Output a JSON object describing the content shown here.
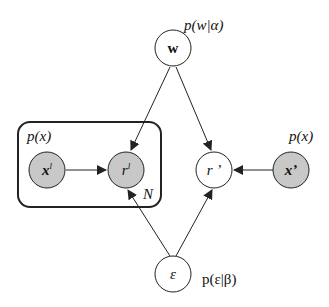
{
  "nodes": {
    "w": {
      "label": "w",
      "shaded": false
    },
    "x_l": {
      "label": "x",
      "sup": "l",
      "shaded": true
    },
    "r_l": {
      "label": "r",
      "sup": "l",
      "shaded": true
    },
    "r_prime": {
      "label": "r ’",
      "shaded": false
    },
    "x_prime": {
      "label": "x’",
      "shaded": true
    },
    "epsilon": {
      "label": "ε",
      "shaded": false
    }
  },
  "labels": {
    "p_w": "p(w|α)",
    "p_x_plate": "p(x)",
    "p_x_right": "p(x)",
    "p_eps": "p(ε|β)",
    "plate_N": "N"
  },
  "colors": {
    "shaded": "#c8c8c8",
    "stroke": "#222222"
  }
}
